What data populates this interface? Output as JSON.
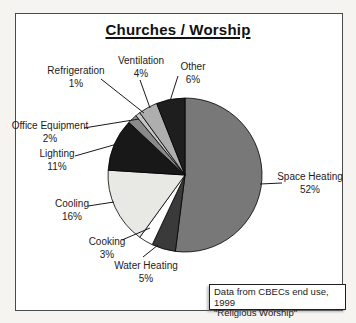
{
  "title": "Churches / Worship",
  "source_note": {
    "line1": "Data from CBECs end use, 1999",
    "line2": "\"Religious Worship\""
  },
  "chart_data": {
    "type": "pie",
    "title": "Churches / Worship",
    "start_angle_deg": 0,
    "direction": "clockwise",
    "legend_position": "none",
    "labels_style": "outside with leader lines, name and percent on two lines",
    "center_px": [
      185,
      175
    ],
    "radius_px": 77,
    "outline_color": "#000000",
    "slices": [
      {
        "label": "Space Heating",
        "pct": 52,
        "color": "#787878",
        "label_pos": [
          310,
          171
        ],
        "leader": [
          282,
          183,
          260,
          184
        ]
      },
      {
        "label": "Water Heating",
        "pct": 5,
        "color": "#3a3a3a",
        "label_pos": [
          146,
          260
        ],
        "leader": [
          143,
          257,
          158,
          245
        ]
      },
      {
        "label": "Cooking",
        "pct": 3,
        "color": "#ffffff",
        "label_pos": [
          107,
          236
        ],
        "leader": [
          122,
          240,
          150,
          228
        ]
      },
      {
        "label": "Cooling",
        "pct": 16,
        "color": "#e8e8e5",
        "label_pos": [
          72,
          198
        ],
        "leader": [
          88,
          206,
          114,
          202
        ]
      },
      {
        "label": "Lighting",
        "pct": 11,
        "color": "#181818",
        "label_pos": [
          57,
          148
        ],
        "leader": [
          75,
          156,
          117,
          144
        ]
      },
      {
        "label": "Office Equipment",
        "pct": 2,
        "color": "#8a8a8a",
        "label_pos": [
          50,
          120
        ],
        "leader": [
          84,
          128,
          139,
          119
        ]
      },
      {
        "label": "Refrigeration",
        "pct": 1,
        "color": "#c4c4c4",
        "label_pos": [
          76,
          65
        ],
        "leader": [
          101,
          79,
          144,
          113
        ]
      },
      {
        "label": "Ventilation",
        "pct": 4,
        "color": "#aeaeae",
        "label_pos": [
          141,
          55
        ],
        "leader": [
          140,
          80,
          150,
          108
        ]
      },
      {
        "label": "Other",
        "pct": 6,
        "color": "#1e1e1e",
        "label_pos": [
          193,
          61
        ],
        "leader": [
          178,
          76,
          170,
          101
        ]
      }
    ]
  }
}
